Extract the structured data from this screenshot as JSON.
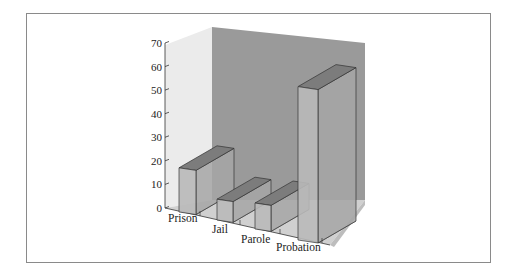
{
  "chart_data": {
    "type": "bar",
    "style": "3d",
    "title": "",
    "xlabel": "",
    "ylabel": "",
    "categories": [
      "Prison",
      "Jail",
      "Parole",
      "Probation"
    ],
    "values": [
      17,
      8,
      10,
      59
    ],
    "ylim": [
      0,
      70
    ],
    "yticks": [
      0,
      10,
      20,
      30,
      40,
      50,
      60,
      70
    ],
    "grid": false,
    "legend": null
  },
  "colors": {
    "back_wall": "#9a9a9a",
    "left_wall": "#ebebeb",
    "floor": "#d0d0d0",
    "bar_front": "#b9b9b9",
    "bar_side": "#a6a6a6",
    "bar_top": "#7c7c7c",
    "frame": "#8a8a8a"
  }
}
